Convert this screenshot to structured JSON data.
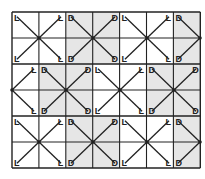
{
  "diagram": {
    "title": "",
    "light_label": "L",
    "dark_label": "D",
    "colors": {
      "light": "#ffffff",
      "dark": "#e6e6e6",
      "line": "#222222"
    },
    "grid": {
      "x0": 12,
      "y0": 12,
      "cols": 7,
      "rows": 6,
      "cell_w": 26.9,
      "cell_h": 26
    },
    "blocks": [
      {
        "col": 0,
        "row": 0,
        "w": 2,
        "type": "L",
        "center": [
          39,
          38
        ]
      },
      {
        "col": 2,
        "row": 0,
        "w": 2,
        "type": "D",
        "center": [
          93,
          38
        ]
      },
      {
        "col": 4,
        "row": 0,
        "w": 2,
        "type": "L",
        "center": [
          147,
          38
        ]
      },
      {
        "col": 6,
        "row": 0,
        "w": 1,
        "type": "D",
        "center": [
          200,
          38
        ]
      },
      {
        "col": 0,
        "row": 2,
        "w": 1,
        "type": "L",
        "center": [
          12,
          90
        ]
      },
      {
        "col": 1,
        "row": 2,
        "w": 2,
        "type": "D",
        "center": [
          66,
          90
        ]
      },
      {
        "col": 3,
        "row": 2,
        "w": 2,
        "type": "L",
        "center": [
          120,
          90
        ]
      },
      {
        "col": 5,
        "row": 2,
        "w": 2,
        "type": "D",
        "center": [
          174,
          90
        ]
      },
      {
        "col": 0,
        "row": 4,
        "w": 2,
        "type": "L",
        "center": [
          39,
          142
        ]
      },
      {
        "col": 2,
        "row": 4,
        "w": 2,
        "type": "D",
        "center": [
          93,
          142
        ]
      },
      {
        "col": 4,
        "row": 4,
        "w": 2,
        "type": "L",
        "center": [
          147,
          142
        ]
      },
      {
        "col": 6,
        "row": 4,
        "w": 1,
        "type": "D",
        "center": [
          200,
          142
        ]
      }
    ]
  }
}
